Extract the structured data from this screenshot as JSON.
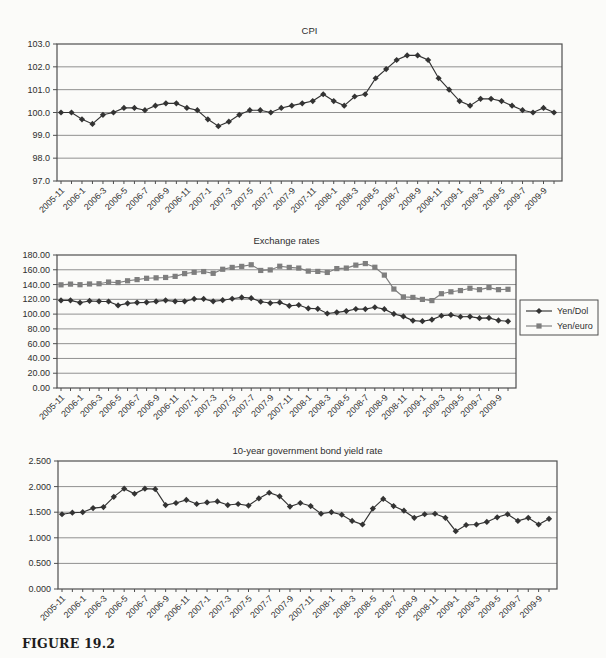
{
  "figure": {
    "caption": "FIGURE 19.2"
  },
  "colors": {
    "background": "#fbfbf9",
    "text": "#2e2e2e",
    "grid": "#909090",
    "axis": "#4f4f4f",
    "series_dark": "#333333",
    "series_gray": "#7e7e7e"
  },
  "months": [
    "2005-11",
    "2005-12",
    "2006-1",
    "2006-2",
    "2006-3",
    "2006-4",
    "2006-5",
    "2006-6",
    "2006-7",
    "2006-8",
    "2006-9",
    "2006-10",
    "2006-11",
    "2006-12",
    "2007-1",
    "2007-2",
    "2007-3",
    "2007-4",
    "2007-5",
    "2007-6",
    "2007-7",
    "2007-8",
    "2007-9",
    "2007-10",
    "2007-11",
    "2007-12",
    "2008-1",
    "2008-2",
    "2008-3",
    "2008-4",
    "2008-5",
    "2008-6",
    "2008-7",
    "2008-8",
    "2008-9",
    "2008-10",
    "2008-11",
    "2008-12",
    "2009-1",
    "2009-2",
    "2009-3",
    "2009-4",
    "2009-5",
    "2009-6",
    "2009-7",
    "2009-8",
    "2009-9",
    "2009-10"
  ],
  "x_tick_labels": [
    "2005-11",
    "2006-1",
    "2006-3",
    "2006-5",
    "2006-7",
    "2006-9",
    "2006-11",
    "2007-1",
    "2007-3",
    "2007-5",
    "2007-7",
    "2007-9",
    "2007-11",
    "2008-1",
    "2008-3",
    "2008-5",
    "2008-7",
    "2008-9",
    "2008-11",
    "2009-1",
    "2009-3",
    "2009-5",
    "2009-7",
    "2009-9"
  ],
  "x_tick_every": 2,
  "chart_data": [
    {
      "type": "line",
      "title": "CPI",
      "xlabel": "",
      "ylabel": "",
      "ylim": [
        97.0,
        103.0
      ],
      "ystep": 1.0,
      "ydecimals": 1,
      "grid": true,
      "legend_position": null,
      "series": [
        {
          "name": "CPI",
          "marker": "diamond",
          "color_key": "series_dark",
          "values": [
            100.0,
            100.0,
            99.7,
            99.5,
            99.9,
            100.0,
            100.2,
            100.2,
            100.1,
            100.3,
            100.4,
            100.4,
            100.2,
            100.1,
            99.7,
            99.4,
            99.6,
            99.9,
            100.1,
            100.1,
            100.0,
            100.2,
            100.3,
            100.4,
            100.5,
            100.8,
            100.5,
            100.3,
            100.7,
            100.8,
            101.5,
            101.9,
            102.3,
            102.5,
            102.5,
            102.3,
            101.5,
            101.0,
            100.5,
            100.3,
            100.6,
            100.6,
            100.5,
            100.3,
            100.1,
            100.0,
            100.2,
            100.0
          ]
        }
      ]
    },
    {
      "type": "line",
      "title": "Exchange rates",
      "xlabel": "",
      "ylabel": "",
      "ylim": [
        0.0,
        180.0
      ],
      "ystep": 20.0,
      "ydecimals": 2,
      "grid": true,
      "legend_position": "right",
      "legend_entries": [
        "Yen/Dol",
        "Yen/euro"
      ],
      "series": [
        {
          "name": "Yen/Dol",
          "marker": "diamond",
          "color_key": "series_dark",
          "values": [
            118.5,
            118.6,
            115.5,
            117.8,
            117.3,
            117.1,
            111.8,
            114.6,
            115.6,
            115.9,
            117.2,
            118.6,
            117.3,
            117.3,
            120.5,
            120.5,
            117.3,
            118.8,
            120.8,
            122.6,
            121.6,
            116.7,
            115.0,
            115.8,
            111.2,
            112.3,
            107.7,
            107.2,
            100.8,
            102.4,
            104.1,
            106.9,
            106.8,
            109.3,
            106.7,
            100.2,
            96.9,
            91.2,
            90.4,
            92.5,
            97.8,
            98.9,
            96.4,
            96.6,
            94.5,
            94.9,
            91.4,
            90.3
          ]
        },
        {
          "name": "Yen/euro",
          "marker": "square",
          "color_key": "series_gray",
          "values": [
            139.6,
            140.6,
            139.8,
            140.8,
            141.1,
            143.4,
            142.7,
            145.1,
            146.7,
            148.5,
            149.1,
            149.6,
            151.1,
            154.8,
            156.6,
            157.6,
            155.2,
            160.7,
            163.2,
            164.6,
            166.8,
            159.1,
            159.8,
            164.8,
            163.2,
            162.3,
            158.2,
            157.8,
            156.4,
            161.6,
            162.3,
            166.3,
            168.4,
            163.4,
            152.8,
            133.9,
            123.3,
            122.6,
            119.9,
            118.3,
            127.6,
            130.2,
            131.9,
            135.0,
            133.1,
            135.9,
            133.1,
            133.6
          ]
        }
      ]
    },
    {
      "type": "line",
      "title": "10-year government bond yield rate",
      "xlabel": "",
      "ylabel": "",
      "ylim": [
        0.0,
        2.5
      ],
      "ystep": 0.5,
      "ydecimals": 3,
      "grid": true,
      "legend_position": null,
      "series": [
        {
          "name": "10-year government bond yield rate",
          "marker": "diamond",
          "color_key": "series_dark",
          "values": [
            1.46,
            1.49,
            1.5,
            1.58,
            1.6,
            1.8,
            1.96,
            1.86,
            1.96,
            1.95,
            1.64,
            1.68,
            1.74,
            1.66,
            1.69,
            1.71,
            1.64,
            1.66,
            1.63,
            1.77,
            1.88,
            1.81,
            1.61,
            1.68,
            1.62,
            1.47,
            1.5,
            1.45,
            1.33,
            1.26,
            1.57,
            1.76,
            1.62,
            1.53,
            1.39,
            1.46,
            1.47,
            1.39,
            1.13,
            1.25,
            1.26,
            1.31,
            1.4,
            1.46,
            1.33,
            1.39,
            1.26,
            1.37
          ]
        }
      ]
    }
  ]
}
